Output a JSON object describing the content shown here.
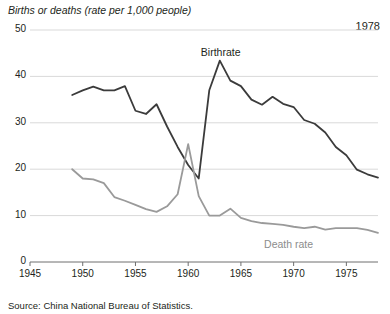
{
  "header": {
    "axis_title": "Births or deaths (rate per 1,000 people)",
    "year_label": "1978"
  },
  "footer": {
    "source": "Source: China National Bureau of Statistics."
  },
  "labels": {
    "birthrate": "Birthrate",
    "deathrate": "Death rate"
  },
  "colors": {
    "birthrate": "#3b3b3b",
    "deathrate": "#9a9a9a",
    "grid": "#d9d9d9",
    "axis": "#6e6e6e",
    "text": "#231f20"
  },
  "chart_data": {
    "type": "line",
    "title": "Births or deaths (rate per 1,000 people)",
    "xlabel": "",
    "ylabel": "Births or deaths (rate per 1,000 people)",
    "xlim": [
      1945,
      1978
    ],
    "ylim": [
      0,
      50
    ],
    "yticks": [
      0,
      10,
      20,
      30,
      40,
      50
    ],
    "xticks": [
      1945,
      1950,
      1955,
      1960,
      1965,
      1970,
      1975
    ],
    "grid": "horizontal",
    "legend": "inline-annotations",
    "annotations": [
      {
        "text": "1978",
        "x": 1978,
        "y": 48
      },
      {
        "text": "Birthrate",
        "x": 1962,
        "y": 45
      },
      {
        "text": "Death rate",
        "x": 1968,
        "y": 5
      }
    ],
    "series": [
      {
        "name": "Birthrate",
        "color": "#3b3b3b",
        "x": [
          1949,
          1950,
          1951,
          1952,
          1953,
          1954,
          1955,
          1956,
          1957,
          1958,
          1959,
          1960,
          1961,
          1962,
          1963,
          1964,
          1965,
          1966,
          1967,
          1968,
          1969,
          1970,
          1971,
          1972,
          1973,
          1974,
          1975,
          1976,
          1977,
          1978
        ],
        "values": [
          36.0,
          37.0,
          37.8,
          37.0,
          37.0,
          37.9,
          32.6,
          31.9,
          34.0,
          29.2,
          24.8,
          20.9,
          18.0,
          37.0,
          43.4,
          39.1,
          37.9,
          35.0,
          33.9,
          35.6,
          34.1,
          33.4,
          30.6,
          29.8,
          27.9,
          24.8,
          23.0,
          19.9,
          18.9,
          18.2
        ]
      },
      {
        "name": "Death rate",
        "color": "#9a9a9a",
        "x": [
          1949,
          1950,
          1951,
          1952,
          1953,
          1954,
          1955,
          1956,
          1957,
          1958,
          1959,
          1960,
          1961,
          1962,
          1963,
          1964,
          1965,
          1966,
          1967,
          1968,
          1969,
          1970,
          1971,
          1972,
          1973,
          1974,
          1975,
          1976,
          1977,
          1978
        ],
        "values": [
          20.0,
          18.0,
          17.8,
          17.0,
          14.0,
          13.2,
          12.3,
          11.4,
          10.8,
          12.0,
          14.6,
          25.4,
          14.2,
          10.0,
          10.0,
          11.5,
          9.5,
          8.8,
          8.4,
          8.2,
          8.0,
          7.6,
          7.3,
          7.6,
          7.0,
          7.3,
          7.3,
          7.3,
          6.9,
          6.3
        ]
      }
    ]
  }
}
